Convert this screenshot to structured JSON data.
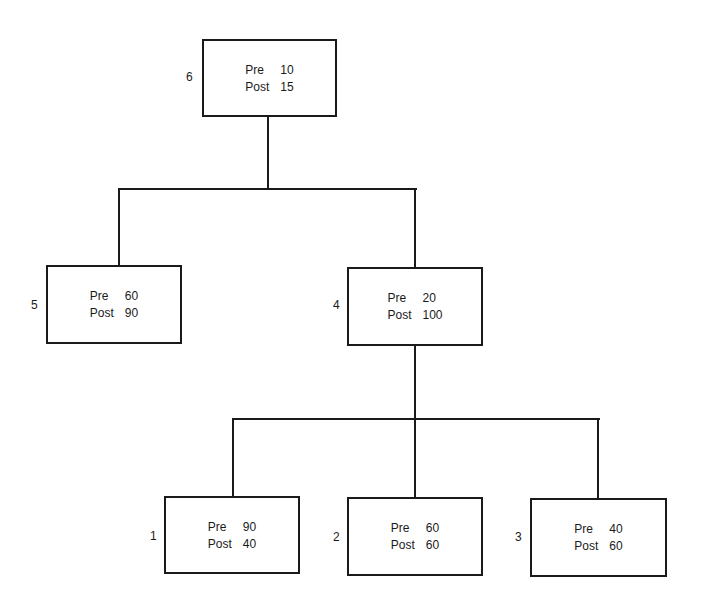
{
  "diagram": {
    "type": "tree",
    "nodes": [
      {
        "id": "6",
        "label": "6",
        "pre_label": "Pre",
        "pre": "10",
        "post_label": "Post",
        "post": "15",
        "parent": null
      },
      {
        "id": "5",
        "label": "5",
        "pre_label": "Pre",
        "pre": "60",
        "post_label": "Post",
        "post": "90",
        "parent": "6"
      },
      {
        "id": "4",
        "label": "4",
        "pre_label": "Pre",
        "pre": "20",
        "post_label": "Post",
        "post": "100",
        "parent": "6"
      },
      {
        "id": "1",
        "label": "1",
        "pre_label": "Pre",
        "pre": "90",
        "post_label": "Post",
        "post": "40",
        "parent": "4"
      },
      {
        "id": "2",
        "label": "2",
        "pre_label": "Pre",
        "pre": "60",
        "post_label": "Post",
        "post": "60",
        "parent": "4"
      },
      {
        "id": "3",
        "label": "3",
        "pre_label": "Pre",
        "pre": "40",
        "post_label": "Post",
        "post": "60",
        "parent": "4"
      }
    ]
  }
}
